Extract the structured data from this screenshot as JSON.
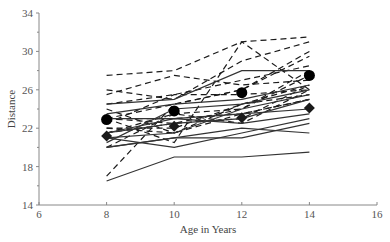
{
  "chart_data": {
    "type": "line",
    "title": "",
    "xlabel": "Age in Years",
    "ylabel": "Distance",
    "xlim": [
      6,
      16
    ],
    "ylim": [
      14,
      34
    ],
    "x_ticks": [
      6,
      8,
      10,
      12,
      14,
      16
    ],
    "y_ticks": [
      14,
      18,
      22,
      26,
      30,
      34
    ],
    "y_minor_ticks": [
      16,
      20,
      24,
      28,
      32
    ],
    "grid": false,
    "legend": null,
    "x": [
      8,
      10,
      12,
      14
    ],
    "series_groups": [
      {
        "name": "Boys",
        "style": "dashed",
        "series": [
          {
            "name": "Boy 1",
            "values": [
              26,
              25,
              29,
              31
            ]
          },
          {
            "name": "Boy 2",
            "values": [
              21.5,
              22.5,
              23,
              26.5
            ]
          },
          {
            "name": "Boy 3",
            "values": [
              23,
              22.5,
              24,
              27.5
            ]
          },
          {
            "name": "Boy 4",
            "values": [
              25.5,
              27.5,
              26.5,
              27
            ]
          },
          {
            "name": "Boy 5",
            "values": [
              20,
              23.5,
              22.5,
              26
            ]
          },
          {
            "name": "Boy 6",
            "values": [
              24.5,
              25.5,
              27,
              28.5
            ]
          },
          {
            "name": "Boy 7",
            "values": [
              22,
              22,
              24.5,
              26.5
            ]
          },
          {
            "name": "Boy 8",
            "values": [
              24,
              21.5,
              24.5,
              25.5
            ]
          },
          {
            "name": "Boy 9",
            "values": [
              23,
              20.5,
              31,
              26
            ]
          },
          {
            "name": "Boy 10",
            "values": [
              27.5,
              28,
              31,
              31.5
            ]
          },
          {
            "name": "Boy 11",
            "values": [
              23,
              23,
              23.5,
              25
            ]
          },
          {
            "name": "Boy 12",
            "values": [
              21.5,
              23.5,
              24,
              28
            ]
          },
          {
            "name": "Boy 13",
            "values": [
              17,
              24.5,
              26,
              29.5
            ]
          },
          {
            "name": "Boy 14",
            "values": [
              22.5,
              25.5,
              25.5,
              26
            ]
          },
          {
            "name": "Boy 15",
            "values": [
              23,
              24.5,
              26,
              30
            ]
          },
          {
            "name": "Boy 16",
            "values": [
              22,
              21.5,
              23.5,
              25
            ]
          }
        ],
        "mean": {
          "marker": "circle",
          "values": [
            22.9,
            23.8,
            25.7,
            27.5
          ]
        }
      },
      {
        "name": "Girls",
        "style": "solid",
        "series": [
          {
            "name": "Girl 1",
            "values": [
              21,
              20,
              21.5,
              23
            ]
          },
          {
            "name": "Girl 2",
            "values": [
              21,
              21.5,
              24,
              25.5
            ]
          },
          {
            "name": "Girl 3",
            "values": [
              20.5,
              24,
              24.5,
              26
            ]
          },
          {
            "name": "Girl 4",
            "values": [
              23.5,
              24.5,
              25,
              26.5
            ]
          },
          {
            "name": "Girl 5",
            "values": [
              21.5,
              23,
              22.5,
              23.5
            ]
          },
          {
            "name": "Girl 6",
            "values": [
              20,
              21,
              21,
              22.5
            ]
          },
          {
            "name": "Girl 7",
            "values": [
              21.5,
              22.5,
              23,
              25
            ]
          },
          {
            "name": "Girl 8",
            "values": [
              23,
              23,
              23.5,
              24
            ]
          },
          {
            "name": "Girl 9",
            "values": [
              20,
              21,
              22,
              21.5
            ]
          },
          {
            "name": "Girl 10",
            "values": [
              16.5,
              19,
              19,
              19.5
            ]
          },
          {
            "name": "Girl 11",
            "values": [
              24.5,
              25,
              28,
              28
            ]
          }
        ],
        "mean": {
          "marker": "diamond",
          "values": [
            21.2,
            22.2,
            23.1,
            24.1
          ]
        }
      }
    ]
  },
  "axes": {
    "x_title": "Age in Years",
    "y_title": "Distance"
  },
  "colors": {
    "line": "#1a1a1a",
    "axis": "#888888",
    "text": "#555555",
    "background": "#ffffff"
  }
}
